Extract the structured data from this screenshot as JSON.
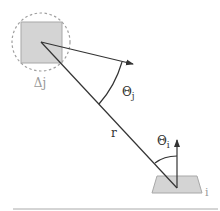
{
  "diagram": {
    "labels": {
      "source_patch": "Δj",
      "theta_j": "Θj",
      "theta_j_base": "Θ",
      "theta_j_sub": "j",
      "distance": "r",
      "theta_i_base": "Θ",
      "theta_i_sub": "i",
      "receiver_patch": "i"
    },
    "colors": {
      "line": "#333333",
      "patch_fill": "#d4d4d4",
      "patch_stroke": "#a8a8a8",
      "dashed_circle": "#a0a0a0",
      "label_gray": "#999999",
      "ground_line": "#aaaaaa"
    }
  }
}
